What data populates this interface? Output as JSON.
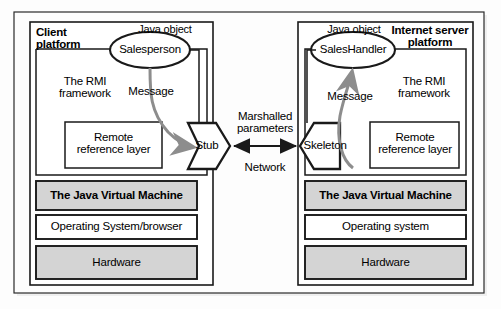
{
  "diagram": {
    "colors": {
      "page_background": "#fdfdfd",
      "stroke": "#1a1a1a",
      "shaded_box_fill": "#d4d4d4",
      "white_box_fill": "#ffffff",
      "arrow_gray": "#8a8a8a"
    },
    "left_platform": {
      "title": "Client\nplatform",
      "java_object_caption": "Java object",
      "object_name": "Salesperson",
      "framework_label": "The RMI\nframework",
      "message_label": "Message",
      "reference_layer_label": "Remote\nreference layer",
      "connector_label": "Stub",
      "stack": [
        {
          "label": "The Java Virtual Machine",
          "shaded": true,
          "bold": true
        },
        {
          "label": "Operating System/browser",
          "shaded": false,
          "bold": false
        },
        {
          "label": "Hardware",
          "shaded": true,
          "bold": false
        }
      ]
    },
    "right_platform": {
      "title": "Internet server\nplatform",
      "java_object_caption": "Java object",
      "object_name": "SalesHandler",
      "framework_label": "The RMI\nframework",
      "message_label": "Message",
      "reference_layer_label": "Remote\nreference layer",
      "connector_label": "Skeleton",
      "stack": [
        {
          "label": "The Java Virtual Machine",
          "shaded": true,
          "bold": true
        },
        {
          "label": "Operating system",
          "shaded": false,
          "bold": false
        },
        {
          "label": "Hardware",
          "shaded": true,
          "bold": false
        }
      ]
    },
    "network": {
      "marshalled_label": "Marshalled\nparameters",
      "network_label": "Network"
    }
  }
}
